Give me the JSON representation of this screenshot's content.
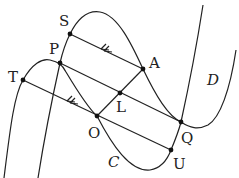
{
  "diagram": {
    "curves": [
      {
        "name": "C",
        "label": "C"
      },
      {
        "name": "D",
        "label": "D"
      }
    ],
    "points": {
      "S": {
        "label": "S",
        "x": 70,
        "y": 34
      },
      "P": {
        "label": "P",
        "x": 60,
        "y": 63
      },
      "T": {
        "label": "T",
        "x": 23,
        "y": 80
      },
      "A": {
        "label": "A",
        "x": 143,
        "y": 69
      },
      "L": {
        "label": "L",
        "x": 120,
        "y": 93
      },
      "O": {
        "label": "O",
        "x": 97,
        "y": 116
      },
      "Q": {
        "label": "Q",
        "x": 181,
        "y": 122
      },
      "U": {
        "label": "U",
        "x": 171,
        "y": 150
      }
    },
    "segments": [
      "S-A",
      "P-Q",
      "T-U",
      "A-O",
      "P-L"
    ],
    "arrows": [
      "A→S",
      "U→T"
    ],
    "stroke_color": "#222222"
  }
}
